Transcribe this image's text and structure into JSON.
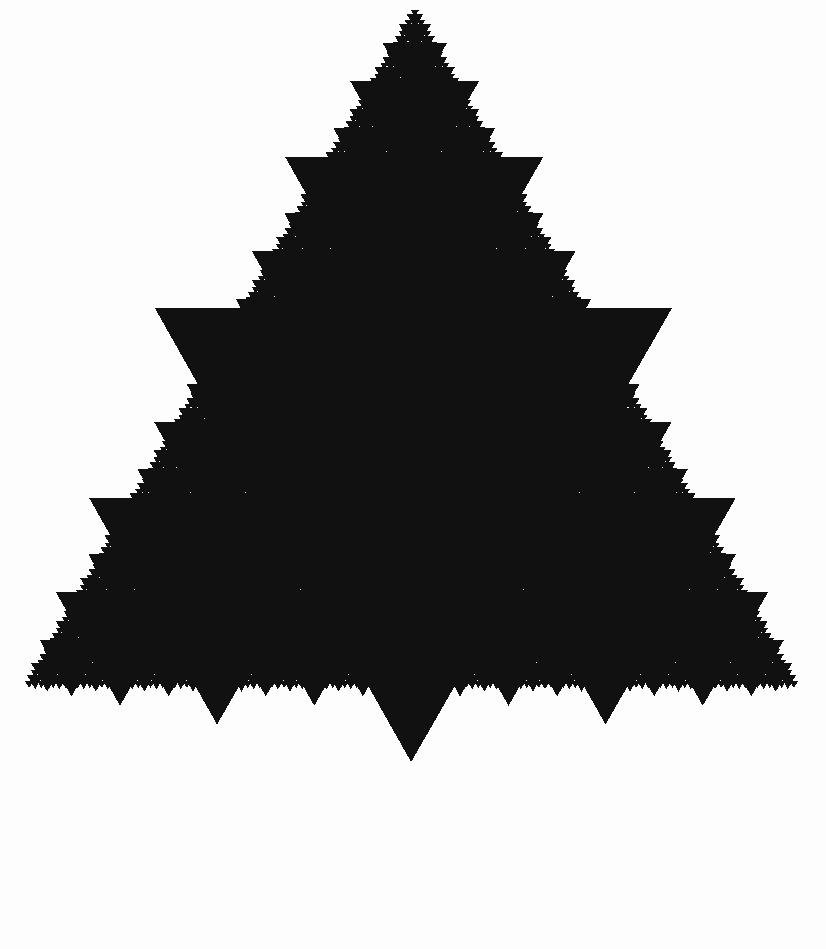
{
  "figure": {
    "kind": "fractal-line-art",
    "canvas": {
      "width": 826,
      "height": 949
    },
    "colors": {
      "background": "#fdfdfd",
      "ink": "#111111"
    },
    "geometry": {
      "outer_triangle": {
        "orientation": "up",
        "apex": {
          "x": 415,
          "y": 5
        },
        "left": {
          "x": 23,
          "y": 687
        },
        "right": {
          "x": 800,
          "y": 687
        },
        "width": 777,
        "height": 682
      },
      "primary_inverted_triangle": {
        "orientation": "down",
        "top_left": {
          "x": 155,
          "y": 462
        },
        "top_right": {
          "x": 672,
          "y": 462
        },
        "tip": {
          "x": 415,
          "y": 908
        },
        "width": 517,
        "height": 446
      },
      "second_level_inverted_triangle": {
        "orientation": "down",
        "top_left": {
          "x": 290,
          "y": 234
        },
        "top_right": {
          "x": 548,
          "y": 234
        },
        "tip": {
          "x": 419,
          "y": 457
        }
      },
      "recursion_depth": 7,
      "inverted_scale_factor": 1.33,
      "child_scale": 0.5,
      "extreme_points": {
        "topmost": {
          "x": 415,
          "y": 5
        },
        "bottommost": {
          "x": 415,
          "y": 908
        },
        "leftmost": {
          "x": 23,
          "y": 687
        },
        "rightmost": {
          "x": 800,
          "y": 687
        }
      }
    }
  },
  "chart_data": {
    "type": "fractal",
    "xlabel": "",
    "ylabel": "",
    "iterations": 7,
    "fill_color": "#111111",
    "background_color": "#fdfdfd",
    "base_vertices": [
      {
        "x": 415,
        "y": 5
      },
      {
        "x": 23,
        "y": 687
      },
      {
        "x": 800,
        "y": 687
      }
    ],
    "level_counts": [
      1,
      3,
      9,
      27,
      81,
      243,
      729
    ],
    "level_widths": [
      517,
      258,
      129,
      65,
      32,
      16,
      8
    ],
    "legend": [],
    "grid": false
  }
}
